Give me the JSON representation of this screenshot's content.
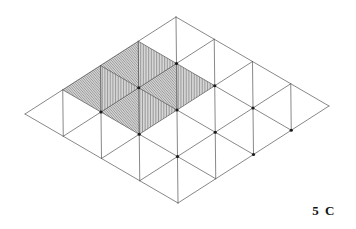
{
  "figure": {
    "label": "5 C",
    "caption_text": "5 C",
    "background_color": "#ffffff",
    "line_color": "#555555",
    "hatch_color": "#3a3a3a",
    "vertex_color": "#1a1a1a",
    "label_color": "#111111"
  },
  "mesh": {
    "type": "triangulated-parallelogram-grid",
    "rows": 4,
    "cols": 4,
    "origin": {
      "x": 25,
      "y": 114
    },
    "u_vector": {
      "x": 37.75,
      "y": -24.25
    },
    "v_vector": {
      "x": 38.25,
      "y": 22.25
    },
    "corners": {
      "left": {
        "x": 25,
        "y": 114
      },
      "top": {
        "x": 176,
        "y": 17
      },
      "right": {
        "x": 329,
        "y": 106
      },
      "bottom": {
        "x": 178,
        "y": 203
      }
    },
    "diagonal_direction": "anti",
    "line_width": 0.7,
    "vertex_dot_radius": 1.6,
    "vertex_dot_cells": [
      [
        1,
        1
      ],
      [
        2,
        1
      ],
      [
        3,
        1
      ],
      [
        1,
        2
      ],
      [
        2,
        2
      ],
      [
        3,
        2
      ],
      [
        1,
        3
      ],
      [
        2,
        3
      ],
      [
        3,
        3
      ],
      [
        2,
        4
      ],
      [
        3,
        4
      ]
    ]
  },
  "hatched_region": {
    "description": "2x2 block of cells hatched with alternating line fills",
    "cell_origin": {
      "i": 1,
      "j": 0
    },
    "cell_span": {
      "i": 2,
      "j": 2
    },
    "cells": [
      {
        "i": 1,
        "j": 0,
        "lower_fill": "vertical",
        "upper_fill": "horizontal"
      },
      {
        "i": 2,
        "j": 0,
        "lower_fill": "vertical",
        "upper_fill": "horizontal"
      },
      {
        "i": 1,
        "j": 1,
        "lower_fill": "vertical",
        "upper_fill": "horizontal"
      },
      {
        "i": 2,
        "j": 1,
        "lower_fill": "vertical",
        "upper_fill": "horizontal"
      }
    ],
    "vertical_hatch_spacing": 1.6,
    "horizontal_hatch_spacing": 1.3,
    "hatch_line_width": 0.55
  }
}
